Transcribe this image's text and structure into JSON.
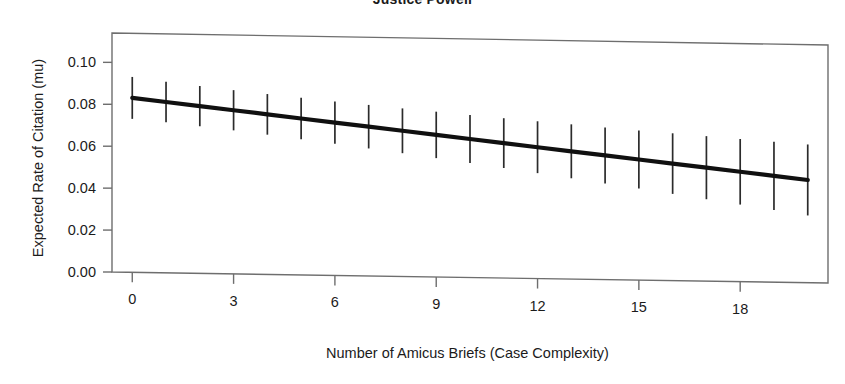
{
  "chart_data": {
    "type": "line",
    "title": "Justice Powell",
    "subtitle": "",
    "xlabel": "Number of Amicus Briefs (Case Complexity)",
    "ylabel": "Expected Rate of Citation (mu)",
    "xlim": [
      -0.6,
      20.6
    ],
    "ylim": [
      0.0,
      0.114
    ],
    "xticks": [
      0,
      3,
      6,
      9,
      12,
      15,
      18
    ],
    "xtick_labels": [
      "0",
      "3",
      "6",
      "9",
      "12",
      "15",
      "18"
    ],
    "yticks": [
      0.0,
      0.02,
      0.04,
      0.06,
      0.08,
      0.1
    ],
    "ytick_labels": [
      "0.00",
      "0.02",
      "0.04",
      "0.06",
      "0.08",
      "0.10"
    ],
    "grid": false,
    "legend": "none",
    "series": [
      {
        "name": "Expected rate of citation (mu)",
        "style": "thick-line-with-error-bars",
        "x": [
          0,
          1,
          2,
          3,
          4,
          5,
          6,
          7,
          8,
          9,
          10,
          11,
          12,
          13,
          14,
          15,
          16,
          17,
          18,
          19,
          20
        ],
        "values": [
          0.0832,
          0.0815,
          0.0798,
          0.0781,
          0.0764,
          0.0747,
          0.073,
          0.0713,
          0.0696,
          0.0679,
          0.0662,
          0.0645,
          0.0628,
          0.0611,
          0.0594,
          0.0577,
          0.056,
          0.0543,
          0.0526,
          0.0509,
          0.0492
        ],
        "ci_lower": [
          0.0732,
          0.0718,
          0.0702,
          0.0685,
          0.0667,
          0.0648,
          0.0629,
          0.0609,
          0.0589,
          0.0568,
          0.0547,
          0.0526,
          0.0504,
          0.0482,
          0.046,
          0.0438,
          0.0415,
          0.0392,
          0.0369,
          0.0346,
          0.0322
        ],
        "ci_upper": [
          0.0932,
          0.0912,
          0.0894,
          0.0877,
          0.0861,
          0.0846,
          0.0831,
          0.0817,
          0.0803,
          0.079,
          0.0777,
          0.0764,
          0.0752,
          0.074,
          0.0728,
          0.0716,
          0.0705,
          0.0694,
          0.0683,
          0.0672,
          0.0662
        ]
      }
    ]
  },
  "figure": {
    "title": "Justice Powell",
    "x_axis_label": "Number of Amicus Briefs (Case Complexity)",
    "y_axis_label": "Expected Rate of Citation (mu)"
  },
  "colors": {
    "line": "#101010",
    "error_bar": "#2b2b2b",
    "frame": "#6e6e6e",
    "text": "#1b1b1b",
    "background": "#ffffff"
  }
}
